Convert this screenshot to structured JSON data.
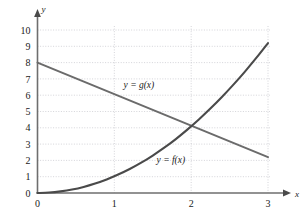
{
  "chart_data": {
    "type": "line",
    "title": "",
    "xlabel": "x",
    "ylabel": "y",
    "xlim": [
      0,
      3
    ],
    "ylim": [
      0,
      10
    ],
    "grid": true,
    "legend_position": "inline-annotation",
    "x_ticks": [
      "0",
      "1",
      "2",
      "3"
    ],
    "x_tick_values": [
      0,
      1,
      2,
      3
    ],
    "y_ticks": [
      "0",
      "1",
      "2",
      "3",
      "4",
      "5",
      "6",
      "7",
      "8",
      "9",
      "10"
    ],
    "y_tick_values": [
      0,
      1,
      2,
      3,
      4,
      5,
      6,
      7,
      8,
      9,
      10
    ],
    "series": [
      {
        "name": "y = f(x)",
        "shape": "increasing-convex",
        "color": "#4a4a4a",
        "label": "y = f(x)",
        "label_x": 1.55,
        "label_y": 1.85,
        "x": [
          0,
          0.15,
          0.3,
          0.45,
          0.6,
          0.75,
          0.9,
          1.05,
          1.2,
          1.35,
          1.5,
          1.65,
          1.8,
          1.95,
          2.1,
          2.25,
          2.4,
          2.55,
          2.7,
          2.85,
          3
        ],
        "values": [
          0,
          0.03,
          0.1,
          0.21,
          0.37,
          0.58,
          0.83,
          1.13,
          1.47,
          1.86,
          2.3,
          2.78,
          3.31,
          3.89,
          4.51,
          5.18,
          5.89,
          6.65,
          7.45,
          8.3,
          9.2
        ]
      },
      {
        "name": "y = g(x)",
        "shape": "decreasing-linear",
        "color": "#6b6b6b",
        "label": "y = g(x)",
        "label_x": 1.12,
        "label_y": 6.45,
        "x": [
          0,
          3
        ],
        "values": [
          8,
          2.2
        ]
      }
    ],
    "intersection": {
      "x": 2.0,
      "y": 4.2
    },
    "colors": {
      "axis": "#6e6e6e",
      "grid": "#c9c9cf",
      "f_curve": "#4a4a4a",
      "g_curve": "#6b6b6b",
      "text": "#1a1a1a",
      "background": "#ffffff"
    }
  },
  "axes": {
    "x_axis_name": "x",
    "y_axis_name": "y"
  }
}
